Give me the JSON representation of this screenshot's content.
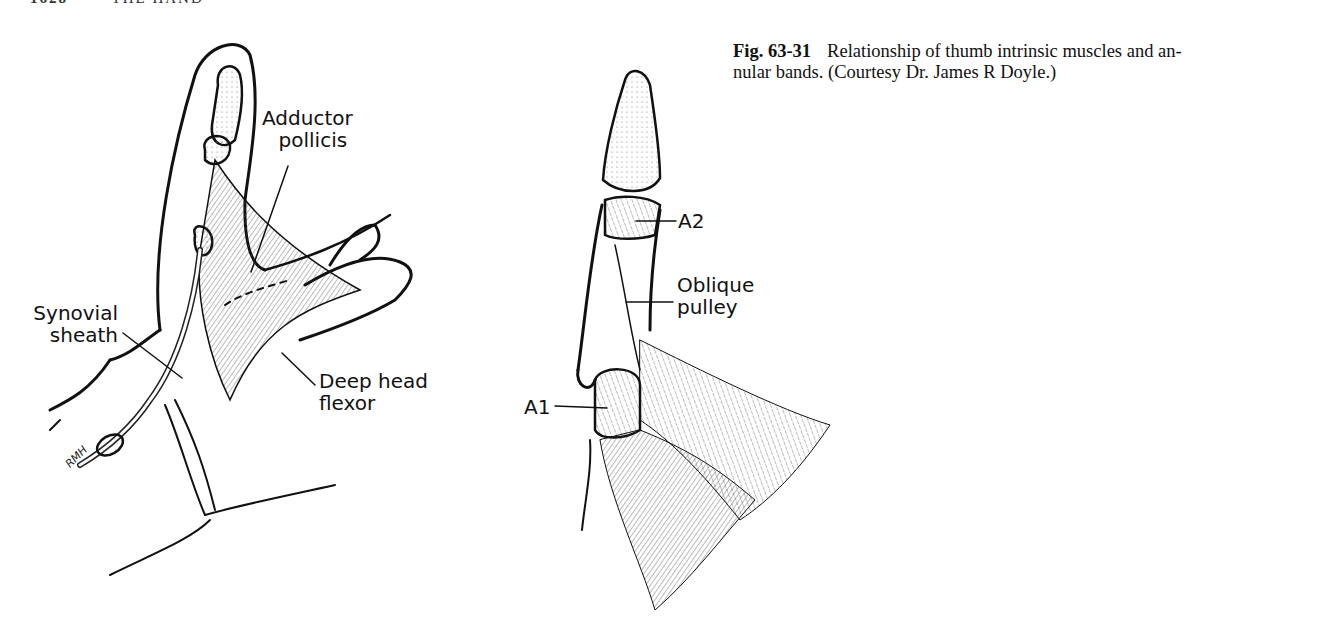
{
  "page": {
    "running_head": {
      "page_number": "1628",
      "section": "THE HAND"
    }
  },
  "figure": {
    "number": "Fig. 63-31",
    "caption": "Relationship of thumb intrinsic muscles and annular bands. (Courtesy Dr. James R Doyle.)",
    "caption_line1": "Relationship of thumb intrinsic muscles and an-",
    "caption_line2": "nular bands. (Courtesy Dr. James R Doyle.)",
    "left_panel": {
      "labels": {
        "adductor_1": "Adductor",
        "adductor_2": "pollicis",
        "synovial_1": "Synovial",
        "synovial_2": "sheath",
        "deep_1": "Deep head",
        "deep_2": "flexor"
      },
      "signature": "RMH"
    },
    "right_panel": {
      "labels": {
        "a2": "A2",
        "oblique_1": "Oblique",
        "oblique_2": "pulley",
        "a1": "A1"
      }
    }
  }
}
